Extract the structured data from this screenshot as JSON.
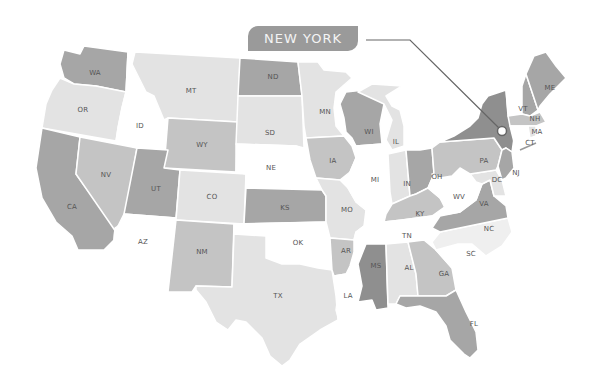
{
  "callout": {
    "label": "NEW YORK",
    "highlighted_state": "NY",
    "box_color": "#9a9a9a",
    "text_color": "#f4f4f4",
    "line_color": "#666666",
    "marker": {
      "x": 502,
      "y": 131
    }
  },
  "palette": {
    "dark": "#8f8f8f",
    "medium_dark": "#a6a6a6",
    "medium": "#c4c4c4",
    "light": "#e3e3e3",
    "very_light": "#efefef",
    "white": "#ffffff"
  },
  "states": [
    {
      "code": "WA",
      "label": "WA",
      "shade": "medium_dark"
    },
    {
      "code": "OR",
      "label": "OR",
      "shade": "light"
    },
    {
      "code": "CA",
      "label": "CA",
      "shade": "medium_dark"
    },
    {
      "code": "NV",
      "label": "NV",
      "shade": "medium"
    },
    {
      "code": "ID",
      "label": "ID",
      "shade": "white"
    },
    {
      "code": "MT",
      "label": "MT",
      "shade": "light"
    },
    {
      "code": "WY",
      "label": "WY",
      "shade": "medium"
    },
    {
      "code": "UT",
      "label": "UT",
      "shade": "medium_dark"
    },
    {
      "code": "AZ",
      "label": "AZ",
      "shade": "white"
    },
    {
      "code": "CO",
      "label": "CO",
      "shade": "light"
    },
    {
      "code": "NM",
      "label": "NM",
      "shade": "medium"
    },
    {
      "code": "ND",
      "label": "ND",
      "shade": "medium_dark"
    },
    {
      "code": "SD",
      "label": "SD",
      "shade": "light"
    },
    {
      "code": "NE",
      "label": "NE",
      "shade": "white"
    },
    {
      "code": "KS",
      "label": "KS",
      "shade": "medium_dark"
    },
    {
      "code": "OK",
      "label": "OK",
      "shade": "white"
    },
    {
      "code": "TX",
      "label": "TX",
      "shade": "light"
    },
    {
      "code": "MN",
      "label": "MN",
      "shade": "light"
    },
    {
      "code": "IA",
      "label": "IA",
      "shade": "medium"
    },
    {
      "code": "MO",
      "label": "MO",
      "shade": "light"
    },
    {
      "code": "AR",
      "label": "AR",
      "shade": "medium"
    },
    {
      "code": "LA",
      "label": "LA",
      "shade": "white"
    },
    {
      "code": "WI",
      "label": "WI",
      "shade": "medium_dark"
    },
    {
      "code": "IL",
      "label": "IL",
      "shade": "white"
    },
    {
      "code": "MI",
      "label": "MI",
      "shade": "light"
    },
    {
      "code": "IN",
      "label": "IN",
      "shade": "light"
    },
    {
      "code": "OH",
      "label": "OH",
      "shade": "medium_dark"
    },
    {
      "code": "KY",
      "label": "KY",
      "shade": "medium"
    },
    {
      "code": "TN",
      "label": "TN",
      "shade": "white"
    },
    {
      "code": "MS",
      "label": "MS",
      "shade": "dark"
    },
    {
      "code": "AL",
      "label": "AL",
      "shade": "light"
    },
    {
      "code": "GA",
      "label": "GA",
      "shade": "medium"
    },
    {
      "code": "FL",
      "label": "FL",
      "shade": "medium_dark"
    },
    {
      "code": "SC",
      "label": "SC",
      "shade": "white"
    },
    {
      "code": "NC",
      "label": "NC",
      "shade": "very_light"
    },
    {
      "code": "VA",
      "label": "VA",
      "shade": "medium_dark"
    },
    {
      "code": "WV",
      "label": "WV",
      "shade": "white"
    },
    {
      "code": "PA",
      "label": "PA",
      "shade": "medium"
    },
    {
      "code": "NY",
      "label": "NY",
      "shade": "dark"
    },
    {
      "code": "VT",
      "label": "VT",
      "shade": "white"
    },
    {
      "code": "NH",
      "label": "NH",
      "shade": "medium_dark"
    },
    {
      "code": "ME",
      "label": "ME",
      "shade": "medium_dark"
    },
    {
      "code": "MA",
      "label": "MA",
      "shade": "medium"
    },
    {
      "code": "CT",
      "label": "CT",
      "shade": "white"
    },
    {
      "code": "NJ",
      "label": "NJ",
      "shade": "medium_dark"
    },
    {
      "code": "DC",
      "label": "DC",
      "shade": "white"
    },
    {
      "code": "MD",
      "label": "",
      "shade": "light"
    }
  ]
}
